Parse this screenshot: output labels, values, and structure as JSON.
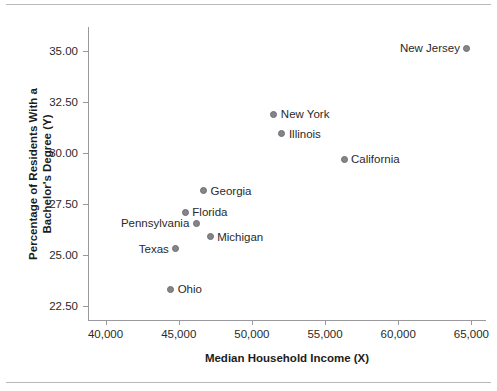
{
  "chart_data": {
    "type": "scatter",
    "title": "",
    "xlabel": "Median Household Income (X)",
    "ylabel": "Percentage of Residents With a Bachelor's Degree (Y)",
    "ylabel_line1": "Percentage of Residents With a",
    "ylabel_line2": "Bachelor's Degree (Y)",
    "xlim": [
      38800,
      66000
    ],
    "ylim": [
      21800,
      36200
    ],
    "xticks": [
      40000,
      45000,
      50000,
      55000,
      60000,
      65000
    ],
    "xticklabels": [
      "40,000",
      "45,000",
      "50,000",
      "55,000",
      "60,000",
      "65,000"
    ],
    "yticks": [
      22.5,
      25.0,
      27.5,
      30.0,
      32.5,
      35.0
    ],
    "yticklabels": [
      "22.50",
      "25.00",
      "27.50",
      "30.00",
      "32.50",
      "35.00"
    ],
    "grid": false,
    "legend": "none",
    "marker_color": "#848489",
    "points": [
      {
        "label": "New Jersey",
        "x": 64700,
        "y": 35.15,
        "label_side": "left"
      },
      {
        "label": "New York",
        "x": 51500,
        "y": 31.9,
        "label_side": "right"
      },
      {
        "label": "Illinois",
        "x": 52050,
        "y": 30.95,
        "label_side": "right"
      },
      {
        "label": "California",
        "x": 56300,
        "y": 29.7,
        "label_side": "right"
      },
      {
        "label": "Georgia",
        "x": 46700,
        "y": 28.15,
        "label_side": "right"
      },
      {
        "label": "Florida",
        "x": 45450,
        "y": 27.1,
        "label_side": "right"
      },
      {
        "label": "Pennsylvania",
        "x": 46200,
        "y": 26.55,
        "label_side": "left"
      },
      {
        "label": "Michigan",
        "x": 47150,
        "y": 25.9,
        "label_side": "right"
      },
      {
        "label": "Texas",
        "x": 44800,
        "y": 25.3,
        "label_side": "left"
      },
      {
        "label": "Ohio",
        "x": 44450,
        "y": 23.3,
        "label_side": "right"
      }
    ]
  }
}
